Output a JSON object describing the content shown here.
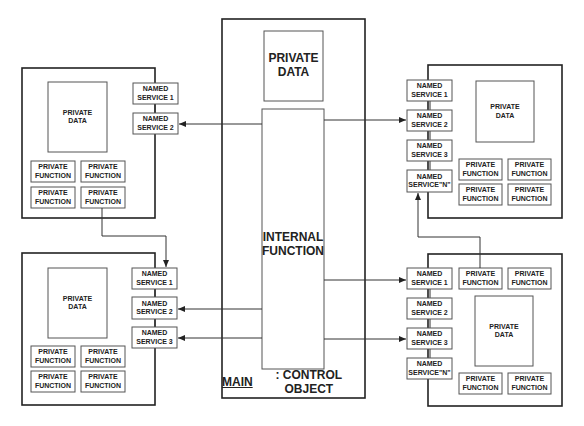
{
  "diagram": {
    "main": {
      "title_prefix": "MAIN",
      "title_suffix": ": CONTROL OBJECT",
      "private_data": "PRIVATE\nDATA",
      "internal_function": "INTERNAL\nFUNCTION"
    },
    "objects": {
      "top_left": {
        "private_data": "PRIVATE\nDATA",
        "services": [
          "NAMED\nSERVICE 1",
          "NAMED\nSERVICE 2"
        ],
        "functions": [
          "PRIVATE\nFUNCTION",
          "PRIVATE\nFUNCTION",
          "PRIVATE\nFUNCTION",
          "PRIVATE\nFUNCTION"
        ]
      },
      "bottom_left": {
        "private_data": "PRIVATE\nDATA",
        "services": [
          "NAMED\nSERVICE 1",
          "NAMED\nSERVICE 2",
          "NAMED\nSERVICE 3"
        ],
        "functions": [
          "PRIVATE\nFUNCTION",
          "PRIVATE\nFUNCTION",
          "PRIVATE\nFUNCTION",
          "PRIVATE\nFUNCTION"
        ]
      },
      "top_right": {
        "private_data": "PRIVATE\nDATA",
        "services": [
          "NAMED\nSERVICE 1",
          "NAMED\nSERVICE 2",
          "NAMED\nSERVICE 3",
          "NAMED\nSERVICE\"N\""
        ],
        "functions": [
          "PRIVATE\nFUNCTION",
          "PRIVATE\nFUNCTION",
          "PRIVATE\nFUNCTION",
          "PRIVATE\nFUNCTION"
        ]
      },
      "bottom_right": {
        "private_data": "PRIVATE\nDATA",
        "services": [
          "NAMED\nSERVICE 1",
          "NAMED\nSERVICE 2",
          "NAMED\nSERVICE 3",
          "NAMED\nSERVICE\"N\""
        ],
        "functions": [
          "PRIVATE\nFUNCTION",
          "PRIVATE\nFUNCTION",
          "PRIVATE\nFUNCTION",
          "PRIVATE\nFUNCTION"
        ]
      }
    },
    "colors": {
      "line": "#222222",
      "background": "#ffffff"
    }
  }
}
